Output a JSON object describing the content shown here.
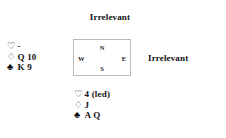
{
  "diagram": {
    "type": "bridge-hand-diagram",
    "background_color": "#ffffff",
    "text_color": "#111111",
    "box_border_color": "#b9b9b9"
  },
  "north": {
    "label": "Irrelevant"
  },
  "east": {
    "label": "Irrelevant"
  },
  "compass": {
    "north": "N",
    "south": "S",
    "west": "W",
    "east": "E"
  },
  "west_hand": {
    "suits": [
      {
        "symbol": "♡",
        "suit_name": "hearts",
        "cards": "-"
      },
      {
        "symbol": "♢",
        "suit_name": "diamonds",
        "cards": "Q 10"
      },
      {
        "symbol": "♣",
        "suit_name": "clubs",
        "cards": "K 9"
      }
    ]
  },
  "south_hand": {
    "suits": [
      {
        "symbol": "♡",
        "suit_name": "hearts",
        "cards": "4 (led)"
      },
      {
        "symbol": "♢",
        "suit_name": "diamonds",
        "cards": "J"
      },
      {
        "symbol": "♣",
        "suit_name": "clubs",
        "cards": "A Q"
      }
    ]
  }
}
